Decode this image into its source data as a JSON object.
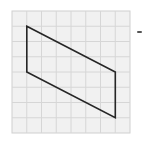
{
  "diagram": {
    "type": "grid-figure",
    "grid": {
      "columns": 8,
      "rows": 8,
      "origin_px": [
        12,
        11
      ],
      "cell_w_px": 14.75,
      "cell_h_px": 15.25,
      "fill_color": "#f1f1f1",
      "line_color": "#d6d6d6",
      "border_color": "#cfcfcf"
    },
    "shape": {
      "name": "parallelogram",
      "vertices_grid": [
        [
          1,
          1
        ],
        [
          7,
          4
        ],
        [
          7,
          7
        ],
        [
          1,
          4
        ]
      ],
      "stroke_color": "#262626",
      "stroke_width": 1.6
    },
    "marks": [
      {
        "name": "stray-dash",
        "position_px": [
          137,
          31
        ]
      }
    ]
  }
}
